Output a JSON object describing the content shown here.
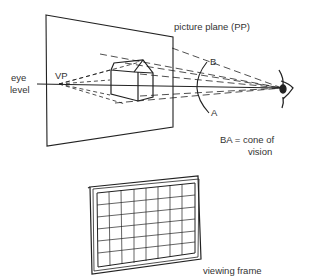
{
  "figure": {
    "labels": {
      "picture_plane": "picture plane (PP)",
      "eye_level_1": "eye",
      "eye_level_2": "level",
      "vp": "VP",
      "point_b": "B",
      "point_a": "A",
      "cone_1": "BA = cone of",
      "cone_2": "vision",
      "viewing_frame": "viewing frame"
    },
    "colors": {
      "ink": "#222222",
      "background": "#ffffff"
    }
  }
}
